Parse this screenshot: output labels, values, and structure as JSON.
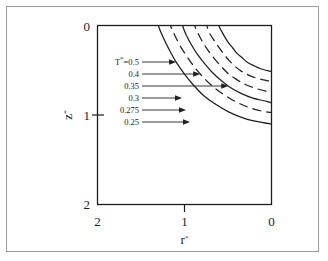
{
  "figure": {
    "background_color": "#ffffff",
    "outer_frame_color": "#9a9a9a",
    "axis_color": "#1d1d1d",
    "curve_color": "#1f1f1f"
  },
  "axes": {
    "x": {
      "title": "r*",
      "title_base": "r",
      "title_star": "*",
      "tick_labels": [
        "2",
        "1",
        "0"
      ],
      "tick_values": [
        2,
        1,
        0
      ],
      "range": [
        2,
        0
      ],
      "reversed": true
    },
    "y": {
      "title": "z*",
      "title_base": "z",
      "title_star": "*",
      "tick_labels": [
        "0",
        "1",
        "2"
      ],
      "tick_values": [
        0,
        1,
        2
      ],
      "range": [
        0,
        2
      ],
      "reversed": false
    }
  },
  "contour_labels": [
    {
      "text": "T*=0.5",
      "prefix": "T",
      "star": "*",
      "suffix": "=0.5",
      "value": 0.5
    },
    {
      "text": "0.4",
      "prefix": "",
      "star": "",
      "suffix": "0.4",
      "value": 0.4
    },
    {
      "text": "0.35",
      "prefix": "",
      "star": "",
      "suffix": "0.35",
      "value": 0.35
    },
    {
      "text": "0.3",
      "prefix": "",
      "star": "",
      "suffix": "0.3",
      "value": 0.3
    },
    {
      "text": "0.275",
      "prefix": "",
      "star": "",
      "suffix": "0.275",
      "value": 0.275
    },
    {
      "text": "0.25",
      "prefix": "",
      "star": "",
      "suffix": "0.25",
      "value": 0.25
    }
  ],
  "chart_data": {
    "type": "line",
    "title": "",
    "subtitle": "",
    "xlabel": "r*",
    "ylabel": "z*",
    "xlim": [
      2,
      0
    ],
    "ylim": [
      0,
      2
    ],
    "x_reversed": true,
    "y_reversed": false,
    "grid": false,
    "legend_position": "inline-leader-labels",
    "annotation_note": "Dimensionless temperature isotherms T* plotted in the (r*, z*) plane; each contour is labelled by a horizontal leader arrow pointing at the curve.",
    "series": [
      {
        "name": "T*=0.5",
        "value": 0.5,
        "style": "solid",
        "comment": "innermost isotherm, closest to the r*=2 / z*=2 far corner",
        "x": [
          1.3,
          1.25,
          1.18,
          1.1,
          1.0,
          0.9,
          0.78,
          0.64,
          0.48,
          0.3,
          0.12,
          0.0
        ],
        "y": [
          0.0,
          0.12,
          0.26,
          0.4,
          0.54,
          0.66,
          0.78,
          0.88,
          0.97,
          1.04,
          1.08,
          1.1
        ]
      },
      {
        "name": "T*=0.4",
        "value": 0.4,
        "style": "dashed",
        "x": [
          1.16,
          1.11,
          1.04,
          0.96,
          0.87,
          0.77,
          0.66,
          0.53,
          0.39,
          0.24,
          0.09,
          0.0
        ],
        "y": [
          0.0,
          0.11,
          0.24,
          0.36,
          0.48,
          0.59,
          0.69,
          0.78,
          0.86,
          0.92,
          0.96,
          0.97
        ]
      },
      {
        "name": "T*=0.35",
        "value": 0.35,
        "style": "solid",
        "x": [
          1.02,
          0.98,
          0.92,
          0.85,
          0.77,
          0.68,
          0.58,
          0.47,
          0.34,
          0.21,
          0.08,
          0.0
        ],
        "y": [
          0.0,
          0.1,
          0.21,
          0.32,
          0.42,
          0.52,
          0.61,
          0.69,
          0.76,
          0.81,
          0.84,
          0.86
        ]
      },
      {
        "name": "T*=0.3",
        "value": 0.3,
        "style": "dashed",
        "x": [
          0.88,
          0.84,
          0.79,
          0.73,
          0.66,
          0.58,
          0.5,
          0.4,
          0.29,
          0.18,
          0.07,
          0.0
        ],
        "y": [
          0.0,
          0.09,
          0.18,
          0.27,
          0.36,
          0.45,
          0.53,
          0.6,
          0.66,
          0.7,
          0.73,
          0.74
        ]
      },
      {
        "name": "T*=0.275",
        "value": 0.275,
        "style": "dashed",
        "x": [
          0.74,
          0.71,
          0.66,
          0.61,
          0.55,
          0.49,
          0.42,
          0.34,
          0.24,
          0.15,
          0.06,
          0.0
        ],
        "y": [
          0.0,
          0.08,
          0.16,
          0.23,
          0.31,
          0.38,
          0.45,
          0.51,
          0.56,
          0.59,
          0.61,
          0.62
        ]
      },
      {
        "name": "T*=0.25",
        "value": 0.25,
        "style": "solid",
        "comment": "outermost isotherm, hugging the r*=0 / z*=0 origin corner",
        "x": [
          0.6,
          0.57,
          0.53,
          0.49,
          0.44,
          0.39,
          0.33,
          0.27,
          0.19,
          0.12,
          0.05,
          0.0
        ],
        "y": [
          0.0,
          0.06,
          0.13,
          0.19,
          0.25,
          0.31,
          0.36,
          0.41,
          0.45,
          0.48,
          0.5,
          0.51
        ]
      }
    ]
  }
}
